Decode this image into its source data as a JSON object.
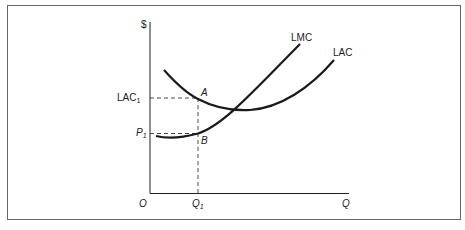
{
  "diagram": {
    "type": "economics-cost-curves",
    "axes": {
      "y_label": "$",
      "x_label": "Q",
      "origin_label": "O"
    },
    "curves": [
      {
        "name": "LMC",
        "label": "LMC",
        "description": "Long-run marginal cost, upward sloping, crosses LAC at its minimum"
      },
      {
        "name": "LAC",
        "label": "LAC",
        "description": "Long-run average cost, U-shaped"
      }
    ],
    "points": [
      {
        "label": "A",
        "description": "Point on LAC at Q1"
      },
      {
        "label": "B",
        "description": "Point on LMC at Q1"
      }
    ],
    "ticks": {
      "y": [
        {
          "main": "LAC",
          "sub": "1"
        },
        {
          "main": "P",
          "sub": "1"
        }
      ],
      "x": [
        {
          "main": "Q",
          "sub": "1"
        }
      ]
    },
    "colors": {
      "line": "#1a1a1a",
      "frame": "#555555",
      "background": "#ffffff"
    }
  }
}
